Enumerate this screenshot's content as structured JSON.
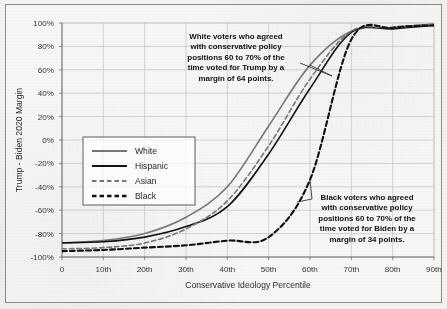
{
  "chart_data": {
    "type": "line",
    "title": "",
    "xlabel": "Conservative Ideology Percentile",
    "ylabel": "Trump - Biden 2020 Margin",
    "x": [
      0,
      10,
      20,
      30,
      40,
      50,
      60,
      70,
      80,
      90
    ],
    "xticklabels": [
      "0",
      "10th",
      "20th",
      "30th",
      "40th",
      "50th",
      "60th",
      "70th",
      "80th",
      "90th"
    ],
    "yticklabels": [
      "100%",
      "80%",
      "60%",
      "40%",
      "20%",
      "0%",
      "-20%",
      "-40%",
      "-60%",
      "-80%",
      "-100%"
    ],
    "ytickvalues": [
      100,
      80,
      60,
      40,
      20,
      0,
      -20,
      -40,
      -60,
      -80,
      -100
    ],
    "xlim": [
      0,
      90
    ],
    "ylim": [
      -100,
      100
    ],
    "grid": true,
    "legend_position": "center-left",
    "series": [
      {
        "name": "White",
        "color": "#767676",
        "style": "solid",
        "width": 1.6,
        "values": [
          -88,
          -86,
          -80,
          -66,
          -40,
          12,
          64,
          93,
          96,
          99
        ]
      },
      {
        "name": "Hispanic",
        "color": "#111111",
        "style": "solid",
        "width": 1.6,
        "values": [
          -88,
          -87,
          -83,
          -74,
          -57,
          -12,
          44,
          92,
          95,
          98
        ]
      },
      {
        "name": "Asian",
        "color": "#767676",
        "style": "dashed",
        "width": 1.6,
        "values": [
          -93,
          -92,
          -88,
          -76,
          -52,
          -5,
          52,
          93,
          96,
          99
        ]
      },
      {
        "name": "Black",
        "color": "#111111",
        "style": "dashed",
        "width": 2.1,
        "values": [
          -95,
          -94,
          -92,
          -90,
          -86,
          -83,
          -34,
          86,
          96,
          98
        ]
      }
    ],
    "annotations": [
      {
        "id": "white-annotation",
        "lines": [
          "White voters who agreed",
          "with conservative policy",
          "positions 60 to 70% of the",
          "time voted for Trump by a",
          "margin of 64 points."
        ],
        "points_to_series": "White",
        "points_to_x": 60,
        "points_to_y": 64
      },
      {
        "id": "black-annotation",
        "lines": [
          "Black voters who agreed",
          "with conservative policy",
          "positions 60 to 70% of the",
          "time voted for Biden by a",
          "margin of 34 points."
        ],
        "points_to_series": "Black",
        "points_to_x": 60,
        "points_to_y": -34
      }
    ]
  }
}
